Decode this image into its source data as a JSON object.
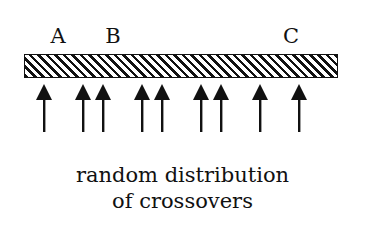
{
  "diagram": {
    "labels": [
      {
        "text": "A",
        "x": 58
      },
      {
        "text": "B",
        "x": 113
      },
      {
        "text": "C",
        "x": 291
      }
    ],
    "bar": {
      "pattern": "diagonal-hatch"
    },
    "arrows_x": [
      44,
      83,
      103,
      142,
      162,
      201,
      221,
      260,
      299
    ],
    "caption_line1": "random distribution",
    "caption_line2": "of crossovers"
  }
}
